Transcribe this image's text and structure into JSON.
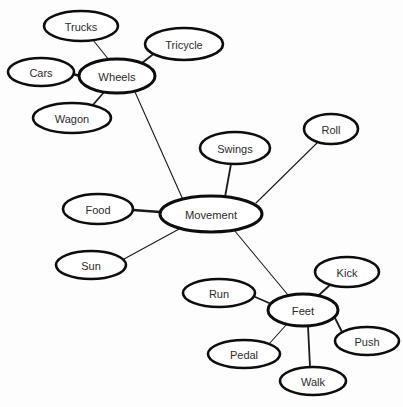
{
  "diagram": {
    "type": "concept-map",
    "background_color": "#fdfdfd",
    "node_fill_color": "#ffffff",
    "node_stroke_color": "#0d0d0d",
    "edge_color": "#1a1a1a",
    "label_color": "#2b2b2b",
    "nodes": [
      {
        "id": "trucks",
        "label": "Trucks",
        "cx": 81,
        "cy": 26,
        "rx": 37,
        "ry": 15,
        "role": "leaf"
      },
      {
        "id": "tricycle",
        "label": "Tricycle",
        "cx": 184,
        "cy": 44,
        "rx": 39,
        "ry": 16,
        "role": "leaf"
      },
      {
        "id": "cars",
        "label": "Cars",
        "cx": 41,
        "cy": 72,
        "rx": 33,
        "ry": 14,
        "role": "leaf"
      },
      {
        "id": "wheels",
        "label": "Wheels",
        "cx": 117,
        "cy": 76,
        "rx": 38,
        "ry": 17,
        "role": "hub"
      },
      {
        "id": "wagon",
        "label": "Wagon",
        "cx": 72,
        "cy": 118,
        "rx": 39,
        "ry": 15,
        "role": "leaf"
      },
      {
        "id": "roll",
        "label": "Roll",
        "cx": 331,
        "cy": 129,
        "rx": 27,
        "ry": 15,
        "role": "leaf"
      },
      {
        "id": "swings",
        "label": "Swings",
        "cx": 235,
        "cy": 148,
        "rx": 35,
        "ry": 16,
        "role": "leaf"
      },
      {
        "id": "food",
        "label": "Food",
        "cx": 98,
        "cy": 209,
        "rx": 35,
        "ry": 15,
        "role": "leaf"
      },
      {
        "id": "movement",
        "label": "Movement",
        "cx": 211,
        "cy": 214,
        "rx": 51,
        "ry": 18,
        "role": "hub"
      },
      {
        "id": "sun",
        "label": "Sun",
        "cx": 91,
        "cy": 265,
        "rx": 35,
        "ry": 14,
        "role": "leaf"
      },
      {
        "id": "kick",
        "label": "Kick",
        "cx": 347,
        "cy": 272,
        "rx": 32,
        "ry": 15,
        "role": "leaf"
      },
      {
        "id": "run",
        "label": "Run",
        "cx": 219,
        "cy": 293,
        "rx": 36,
        "ry": 14,
        "role": "leaf"
      },
      {
        "id": "feet",
        "label": "Feet",
        "cx": 303,
        "cy": 310,
        "rx": 35,
        "ry": 16,
        "role": "hub"
      },
      {
        "id": "push",
        "label": "Push",
        "cx": 367,
        "cy": 341,
        "rx": 32,
        "ry": 14,
        "role": "leaf"
      },
      {
        "id": "pedal",
        "label": "Pedal",
        "cx": 244,
        "cy": 354,
        "rx": 36,
        "ry": 14,
        "role": "leaf"
      },
      {
        "id": "walk",
        "label": "Walk",
        "cx": 313,
        "cy": 381,
        "rx": 33,
        "ry": 14,
        "role": "leaf"
      }
    ],
    "edges": [
      {
        "from": "wheels",
        "to": "trucks",
        "x1": 109,
        "y1": 60,
        "x2": 93,
        "y2": 40,
        "weight": "thin"
      },
      {
        "from": "wheels",
        "to": "tricycle",
        "x1": 142,
        "y1": 63,
        "x2": 156,
        "y2": 52,
        "weight": "med"
      },
      {
        "from": "wheels",
        "to": "cars",
        "x1": 80,
        "y1": 76,
        "x2": 73,
        "y2": 74,
        "weight": "thick"
      },
      {
        "from": "wheels",
        "to": "wagon",
        "x1": 105,
        "y1": 91,
        "x2": 92,
        "y2": 106,
        "weight": "med"
      },
      {
        "from": "wheels",
        "to": "movement",
        "x1": 135,
        "y1": 92,
        "x2": 184,
        "y2": 202,
        "weight": "thin"
      },
      {
        "from": "movement",
        "to": "swings",
        "x1": 225,
        "y1": 197,
        "x2": 231,
        "y2": 164,
        "weight": "med"
      },
      {
        "from": "movement",
        "to": "roll",
        "x1": 256,
        "y1": 203,
        "x2": 318,
        "y2": 142,
        "weight": "thin"
      },
      {
        "from": "movement",
        "to": "food",
        "x1": 160,
        "y1": 212,
        "x2": 133,
        "y2": 210,
        "weight": "thick"
      },
      {
        "from": "movement",
        "to": "sun",
        "x1": 181,
        "y1": 228,
        "x2": 124,
        "y2": 259,
        "weight": "thin"
      },
      {
        "from": "movement",
        "to": "feet",
        "x1": 234,
        "y1": 230,
        "x2": 288,
        "y2": 295,
        "weight": "thin"
      },
      {
        "from": "feet",
        "to": "kick",
        "x1": 318,
        "y1": 296,
        "x2": 331,
        "y2": 284,
        "weight": "med"
      },
      {
        "from": "feet",
        "to": "run",
        "x1": 269,
        "y1": 303,
        "x2": 253,
        "y2": 296,
        "weight": "med"
      },
      {
        "from": "feet",
        "to": "push",
        "x1": 335,
        "y1": 318,
        "x2": 342,
        "y2": 332,
        "weight": "med"
      },
      {
        "from": "feet",
        "to": "pedal",
        "x1": 287,
        "y1": 324,
        "x2": 269,
        "y2": 344,
        "weight": "thin"
      },
      {
        "from": "feet",
        "to": "walk",
        "x1": 308,
        "y1": 326,
        "x2": 310,
        "y2": 367,
        "weight": "med"
      }
    ],
    "caption": {
      "visible_text": "",
      "note": "partially cropped scanned text line at bottom edge, illegible"
    }
  }
}
